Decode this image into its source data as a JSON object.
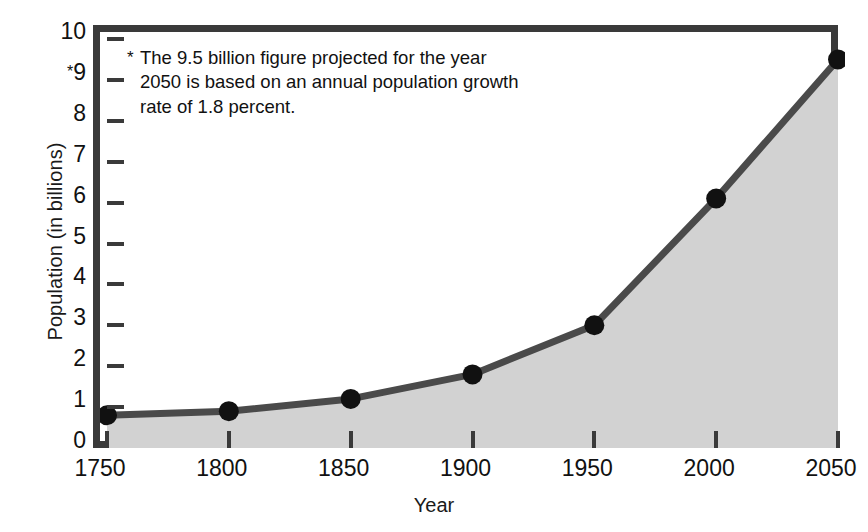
{
  "chart_data": {
    "type": "area",
    "title": "",
    "xlabel": "Year",
    "ylabel": "Population (in billions)",
    "x": [
      1750,
      1800,
      1850,
      1900,
      1950,
      2000,
      2050
    ],
    "categories": [
      "1750",
      "1800",
      "1850",
      "1900",
      "1950",
      "2000",
      "2050"
    ],
    "values": [
      0.8,
      0.9,
      1.2,
      1.8,
      3.0,
      6.1,
      9.5
    ],
    "series": [
      {
        "name": "World population",
        "values": [
          0.8,
          0.9,
          1.2,
          1.8,
          3.0,
          6.1,
          9.5
        ]
      }
    ],
    "xlim": [
      1750,
      2050
    ],
    "ylim": [
      0,
      10
    ],
    "ytick_values": [
      0,
      1,
      2,
      3,
      4,
      5,
      6,
      7,
      8,
      9,
      10
    ],
    "ytick_labels": [
      "0",
      "1",
      "2",
      "3",
      "4",
      "5",
      "6",
      "7",
      "8",
      "9",
      "10"
    ],
    "ytick_star_value": 9,
    "ytick_star_glyph": "*",
    "grid": false,
    "legend": "none",
    "markers": "filled-circle",
    "colors": {
      "line": "#4a4a4a",
      "fill": "#d2d2d2",
      "marker": "#111111",
      "frame": "#3a3a3a",
      "text": "#111111",
      "background": "#ffffff"
    },
    "annotations": [
      {
        "marker": "*",
        "text": "The 9.5 billion figure projected for the year 2050 is based on an annual population growth rate of 1.8 percent.",
        "position": "top-left-inside-plot"
      }
    ]
  },
  "axes": {
    "y": {
      "title": "Population (in billions)",
      "ticks": [
        {
          "label": "10",
          "value": 10,
          "star": ""
        },
        {
          "label": "9",
          "value": 9,
          "star": "*"
        },
        {
          "label": "8",
          "value": 8,
          "star": ""
        },
        {
          "label": "7",
          "value": 7,
          "star": ""
        },
        {
          "label": "6",
          "value": 6,
          "star": ""
        },
        {
          "label": "5",
          "value": 5,
          "star": ""
        },
        {
          "label": "4",
          "value": 4,
          "star": ""
        },
        {
          "label": "3",
          "value": 3,
          "star": ""
        },
        {
          "label": "2",
          "value": 2,
          "star": ""
        },
        {
          "label": "1",
          "value": 1,
          "star": ""
        },
        {
          "label": "0",
          "value": 0,
          "star": ""
        }
      ]
    },
    "x": {
      "title": "Year",
      "ticks": [
        {
          "label": "1750",
          "value": 1750
        },
        {
          "label": "1800",
          "value": 1800
        },
        {
          "label": "1850",
          "value": 1850
        },
        {
          "label": "1900",
          "value": 1900
        },
        {
          "label": "1950",
          "value": 1950
        },
        {
          "label": "2000",
          "value": 2000
        },
        {
          "label": "2050",
          "value": 2050
        }
      ]
    }
  },
  "note": {
    "star": "*",
    "text": "The 9.5 billion figure projected for the year 2050 is based on an annual population growth rate of 1.8 percent."
  }
}
